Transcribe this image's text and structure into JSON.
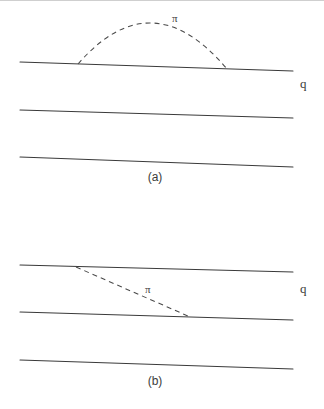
{
  "figure": {
    "background_color": "#ffffff",
    "line_color": "#3a3a3a",
    "dash_color": "#4a4a4a",
    "panels": [
      {
        "id": "panel-a",
        "caption": "(a)",
        "caption_x": 155,
        "caption_y": 177,
        "momentum_label": "q",
        "momentum_label_x": 300,
        "momentum_label_y": 77,
        "meson_label": "π",
        "meson_label_x": 172,
        "meson_label_y": 13,
        "nucleon_lines": [
          {
            "x1": 20,
            "y1": 62,
            "x2": 293,
            "y2": 71
          },
          {
            "x1": 20,
            "y1": 110,
            "x2": 293,
            "y2": 118
          },
          {
            "x1": 20,
            "y1": 157,
            "x2": 293,
            "y2": 167
          }
        ],
        "pion_exchange": {
          "type": "arc",
          "start_x": 78,
          "start_y": 64,
          "end_x": 227,
          "end_y": 69,
          "apex_x": 152,
          "apex_y": 23
        }
      },
      {
        "id": "panel-b",
        "caption": "(b)",
        "caption_x": 155,
        "caption_y": 381,
        "momentum_label": "q",
        "momentum_label_x": 300,
        "momentum_label_y": 282,
        "meson_label": "π",
        "meson_label_x": 145,
        "meson_label_y": 284,
        "nucleon_lines": [
          {
            "x1": 20,
            "y1": 265,
            "x2": 293,
            "y2": 272
          },
          {
            "x1": 20,
            "y1": 312,
            "x2": 293,
            "y2": 320
          },
          {
            "x1": 20,
            "y1": 360,
            "x2": 293,
            "y2": 369
          }
        ],
        "pion_exchange": {
          "type": "straight",
          "start_x": 76,
          "start_y": 267,
          "end_x": 188,
          "end_y": 316
        }
      }
    ]
  }
}
